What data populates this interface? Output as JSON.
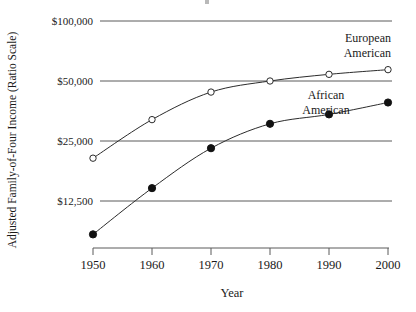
{
  "chart_data": {
    "type": "line",
    "title": "",
    "xlabel": "Year",
    "ylabel": "Adjusted Family-of-Four Income (Ratio Scale)",
    "scale": "log",
    "scale_note": "Ratio Scale",
    "grid": true,
    "legend_position": "inline-annotation",
    "x": [
      1950,
      1960,
      1970,
      1980,
      1990,
      2000
    ],
    "xtick_labels": [
      "1950",
      "1960",
      "1970",
      "1980",
      "1990",
      "2000"
    ],
    "xlim": [
      1950,
      2000
    ],
    "ylim": [
      7000,
      115000
    ],
    "ytick_values": [
      12500,
      25000,
      50000,
      100000
    ],
    "ytick_labels": [
      "$12,500",
      "$25,000",
      "$50,000",
      "$100,000"
    ],
    "series": [
      {
        "name": "European American",
        "marker": "open-circle",
        "values": [
          20500,
          32000,
          44000,
          50000,
          54000,
          57000
        ]
      },
      {
        "name": "African American",
        "marker": "filled-circle",
        "values": [
          8500,
          14500,
          23000,
          30500,
          34000,
          39000
        ]
      }
    ],
    "annotations": [
      {
        "text_line1": "European",
        "text_line2": "American",
        "align": "right"
      },
      {
        "text_line1": "African",
        "text_line2": "American",
        "align": "center"
      }
    ]
  },
  "axis": {
    "y_title": "Adjusted Family-of-Four Income (Ratio Scale)",
    "x_title": "Year",
    "ytick_0": "$12,500",
    "ytick_1": "$25,000",
    "ytick_2": "$50,000",
    "ytick_3": "$100,000",
    "xtick_0": "1950",
    "xtick_1": "1960",
    "xtick_2": "1970",
    "xtick_3": "1980",
    "xtick_4": "1990",
    "xtick_5": "2000"
  },
  "annotations": {
    "european_line1": "European",
    "european_line2": "American",
    "african_line1": "African",
    "african_line2": "American"
  }
}
